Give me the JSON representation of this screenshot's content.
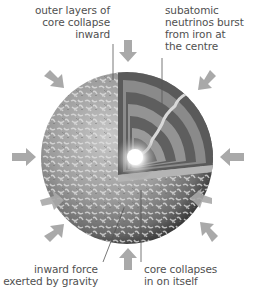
{
  "diagram": {
    "labels": {
      "outer_layers": [
        "outer layers of",
        "core collapse",
        "inward"
      ],
      "neutrinos": [
        "subatomic",
        "neutrinos burst",
        "from iron at",
        "the centre"
      ],
      "gravity": [
        "inward force",
        "exerted by gravity"
      ],
      "core_collapse": [
        "core collapses",
        "in on itself"
      ]
    },
    "arrows": {
      "count": 10,
      "direction": "inward",
      "color": "#a9a9a9"
    },
    "colors": {
      "sphere_surface": "#9a9a9a",
      "sphere_dark": "#3c3c3c",
      "core_glow": "#ffffff",
      "leader_line": "#555555",
      "text": "#505050"
    }
  }
}
